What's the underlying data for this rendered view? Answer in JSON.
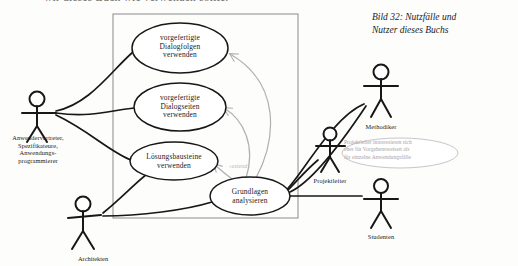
{
  "page": {
    "top_cut_text": "wir dieses Buch wie verwenden sollte.",
    "background_color": "#fdfdfc"
  },
  "caption": {
    "line1": "Bild 32: Nutzfälle und",
    "line2": "Nutzer dieses Buchs"
  },
  "diagram": {
    "type": "uml-use-case-diagram",
    "system_boundary": {
      "x": 113,
      "y": 14,
      "width": 185,
      "height": 204
    },
    "use_cases": [
      {
        "id": "uc1",
        "lines": [
          "vorgefertigte",
          "Dialogfolgen",
          "verwenden"
        ],
        "cx": 180,
        "cy": 48,
        "rx": 48,
        "ry": 25
      },
      {
        "id": "uc2",
        "lines": [
          "vorgefertigte",
          "Dialogseiten",
          "verwenden"
        ],
        "cx": 180,
        "cy": 107,
        "rx": 46,
        "ry": 24
      },
      {
        "id": "uc3",
        "lines": [
          "Lösungsbausteine",
          "verwenden"
        ],
        "cx": 174,
        "cy": 161,
        "rx": 44,
        "ry": 19
      },
      {
        "id": "uc4",
        "lines": [
          "Grundlagen",
          "analysieren"
        ],
        "cx": 250,
        "cy": 196,
        "rx": 40,
        "ry": 19
      }
    ],
    "actors": [
      {
        "id": "anwender",
        "lines": [
          "Anwendervertreter,",
          "Spezifikateure,",
          "Anwendungs-",
          "programmierer"
        ],
        "x": 37,
        "y": 112,
        "label_y": 134
      },
      {
        "id": "architekten",
        "lines": [
          "Architekten"
        ],
        "x": 83,
        "y": 204,
        "label_y": 253
      },
      {
        "id": "methodiker",
        "lines": [
          "Methodiker"
        ],
        "x": 381,
        "y": 72,
        "label_y": 123
      },
      {
        "id": "projektleiter",
        "lines": [
          "Projektleiter"
        ],
        "x": 330,
        "y": 134,
        "label_y": 180
      },
      {
        "id": "studenten",
        "lines": [
          "Studenten"
        ],
        "x": 381,
        "y": 186,
        "label_y": 233
      }
    ],
    "note": {
      "lines": [
        "Projektleiter interessieren sich",
        "eher für Vorgehensweisen als",
        "für einzelne Anwendungsfälle"
      ],
      "cx": 400,
      "cy": 153,
      "rx": 58,
      "ry": 15,
      "color": "#a9a4a9"
    },
    "stereotype_label": "«extend»",
    "colors": {
      "ink": "#1b1b1b",
      "ellipse_stroke": "#171717",
      "boundary_stroke": "#8a8a8a",
      "extend_arrow": "#b2aeb2",
      "note_stroke": "#c9c5c9"
    }
  }
}
